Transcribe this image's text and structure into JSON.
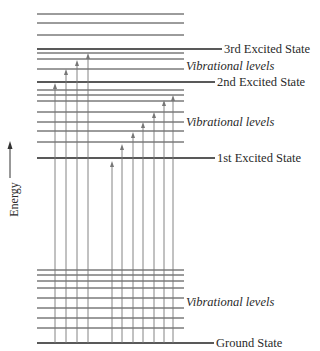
{
  "axis": {
    "label": "Energy"
  },
  "states": [
    {
      "name": "3rd Excited State",
      "y": 49
    },
    {
      "name": "2nd Excited State",
      "y": 82
    },
    {
      "name": "1st Excited State",
      "y": 158
    },
    {
      "name": "Ground State",
      "y": 343
    }
  ],
  "vibrational_labels": [
    {
      "text": "Vibrational levels",
      "y": 66
    },
    {
      "text": "Vibrational levels",
      "y": 122
    },
    {
      "text": "Vibrational levels",
      "y": 302
    }
  ],
  "vibrational_lines": {
    "above_third": [
      14,
      23,
      35
    ],
    "third": [
      53,
      59,
      69
    ],
    "second": [
      90,
      95,
      101,
      112,
      122,
      131,
      142
    ],
    "ground": [
      270,
      275,
      281,
      288,
      298,
      308,
      318,
      328
    ]
  },
  "arrows": [
    {
      "x": 55,
      "tip": 83
    },
    {
      "x": 66,
      "tip": 69
    },
    {
      "x": 77,
      "tip": 60
    },
    {
      "x": 88,
      "tip": 53
    },
    {
      "x": 112,
      "tip": 161
    },
    {
      "x": 122,
      "tip": 144
    },
    {
      "x": 133,
      "tip": 132
    },
    {
      "x": 143,
      "tip": 122
    },
    {
      "x": 154,
      "tip": 112
    },
    {
      "x": 164,
      "tip": 100
    },
    {
      "x": 173,
      "tip": 95
    }
  ],
  "colors": {
    "line": "#222222",
    "arrow": "#777777",
    "background": "#ffffff"
  }
}
